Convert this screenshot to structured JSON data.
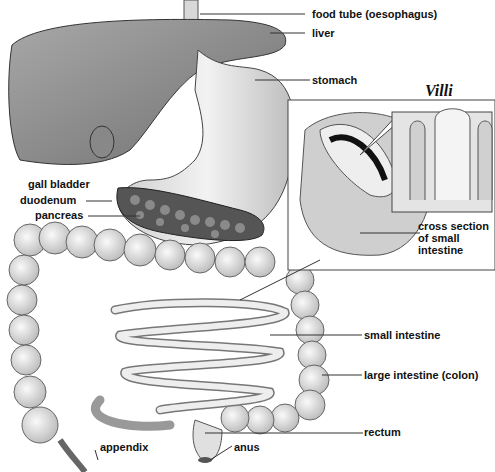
{
  "diagram": {
    "title": "Villi",
    "labels": {
      "food_tube": "food tube (oesophagus)",
      "liver": "liver",
      "stomach": "stomach",
      "gall_bladder": "gall bladder",
      "duodenum": "duodenum",
      "pancreas": "pancreas",
      "cross_section_1": "cross section",
      "cross_section_2": "of small",
      "cross_section_3": "intestine",
      "small_intestine": "small intestine",
      "large_intestine": "large intestine (colon)",
      "rectum": "rectum",
      "anus": "anus",
      "appendix": "appendix"
    },
    "colors": {
      "organ_fill": "#e6e6e6",
      "organ_dark": "#9a9a9a",
      "liver_fill": "#8c8c8c",
      "line": "#333333"
    }
  }
}
